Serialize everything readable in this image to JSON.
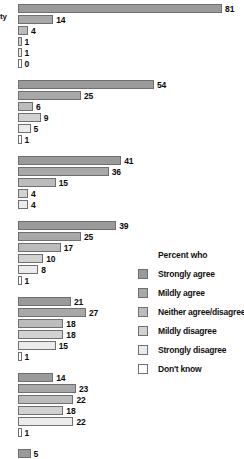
{
  "chart_data": {
    "type": "bar",
    "title": "",
    "xlabel": "",
    "ylabel": "",
    "orientation": "horizontal",
    "grid": false,
    "xlim": [
      0,
      81
    ],
    "legend_position": "right",
    "legend_title": "Percent who",
    "categories": [
      "Strongly agree",
      "Mildly agree",
      "Neither agree/disagree",
      "Mildly disagree",
      "Strongly disagree",
      "Don't know"
    ],
    "category_colors": [
      "#9a9a9a",
      "#a8a8a8",
      "#bcbcbc",
      "#d2d2d2",
      "#ebebeb",
      "#ffffff"
    ],
    "partial_row_label": "ty",
    "groups": [
      {
        "label": "",
        "values": [
          81,
          14,
          4,
          1,
          1,
          0
        ]
      },
      {
        "label": "",
        "values": [
          54,
          25,
          6,
          9,
          5,
          1
        ]
      },
      {
        "label": "",
        "values": [
          41,
          36,
          15,
          4,
          4
        ]
      },
      {
        "label": "",
        "values": [
          39,
          25,
          17,
          10,
          8,
          1
        ]
      },
      {
        "label": "",
        "values": [
          21,
          27,
          18,
          18,
          15,
          1
        ]
      },
      {
        "label": "",
        "values": [
          14,
          23,
          22,
          18,
          22,
          1
        ]
      },
      {
        "label": "",
        "values": [
          5,
          19,
          26,
          20,
          29
        ]
      }
    ]
  },
  "legend": {
    "title": "Percent who",
    "items": [
      {
        "label": "Strongly agree",
        "color": "#9a9a9a"
      },
      {
        "label": "Mildly agree",
        "color": "#a8a8a8"
      },
      {
        "label": "Neither agree/disagree",
        "color": "#bcbcbc"
      },
      {
        "label": "Mildly disagree",
        "color": "#d2d2d2"
      },
      {
        "label": "Strongly disagree",
        "color": "#ebebeb"
      },
      {
        "label": "Don't know",
        "color": "#ffffff"
      }
    ]
  }
}
